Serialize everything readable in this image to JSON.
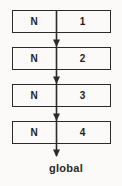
{
  "figure": {
    "label": "global",
    "nodes": [
      {
        "name": "N",
        "value": "1"
      },
      {
        "name": "N",
        "value": "2"
      },
      {
        "name": "N",
        "value": "3"
      },
      {
        "name": "N",
        "value": "4"
      }
    ],
    "colors": {
      "line": "#2b2b2b",
      "background": "#fbfaf8",
      "text": "#1f1f1f"
    }
  }
}
